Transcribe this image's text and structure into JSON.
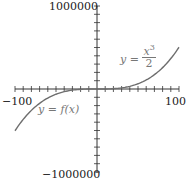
{
  "chart_data": {
    "type": "line",
    "title": "",
    "xlabel": "",
    "ylabel": "",
    "xlim": [
      -100,
      100
    ],
    "ylim": [
      -1000000,
      1000000
    ],
    "x_tick_labels": [
      "-100",
      "100"
    ],
    "y_tick_labels": [
      "1000000",
      "-1000000"
    ],
    "x_minor_ticks_per_side": 10,
    "y_minor_ticks_per_side": 10,
    "grid": false,
    "series": [
      {
        "name": "y = x^3/2",
        "function": "x^3/2",
        "domain": [
          0,
          100
        ],
        "x": [
          0,
          20,
          40,
          60,
          80,
          100
        ],
        "values": [
          0,
          4000,
          32000,
          108000,
          256000,
          500000
        ]
      },
      {
        "name": "y = f(x)",
        "function": "x^3/2",
        "domain": [
          -100,
          0
        ],
        "x": [
          -100,
          -80,
          -60,
          -40,
          -20,
          0
        ],
        "values": [
          -500000,
          -256000,
          -108000,
          -32000,
          -4000,
          0
        ]
      }
    ],
    "annotations": [
      {
        "text": "y = x^3/2",
        "position": "upper right, near curve"
      },
      {
        "text": "y = f(x)",
        "position": "lower left, near curve"
      }
    ]
  },
  "labels": {
    "y_max": "1000000",
    "y_min": "−1000000",
    "x_min": "−100",
    "x_max": "100",
    "eq_right_prefix": "y = ",
    "eq_right_num": "x",
    "eq_right_exp": "3",
    "eq_right_den": "2",
    "eq_left": "y = f(x)"
  },
  "colors": {
    "axis": "#333333",
    "curve": "#6e6e6e",
    "text": "#222222",
    "equation": "#777777"
  }
}
